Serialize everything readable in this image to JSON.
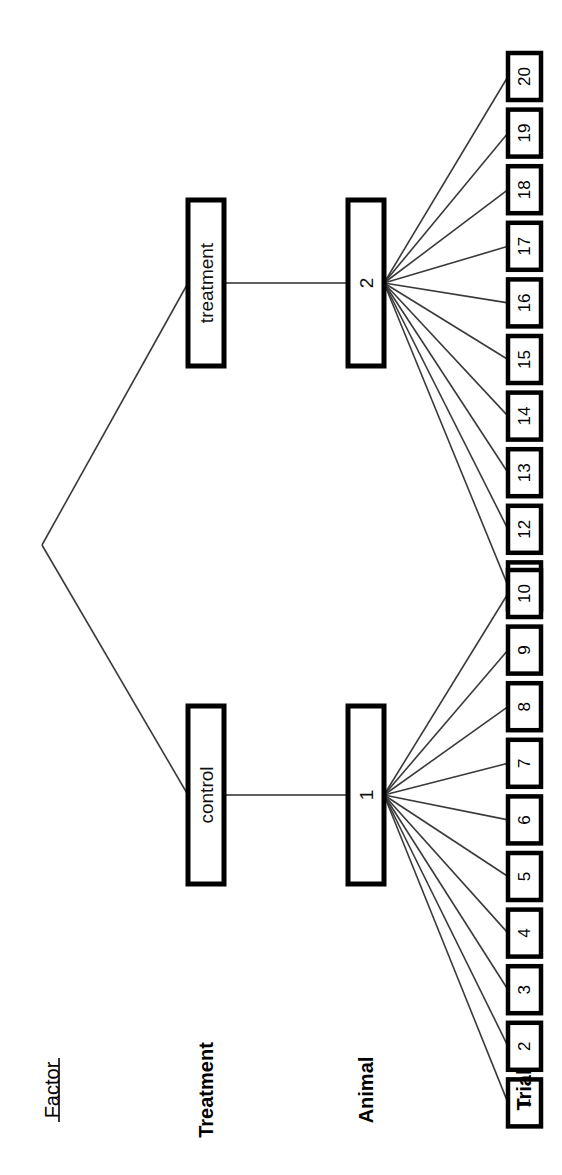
{
  "figure": {
    "orientation": "rotated-90-ccw",
    "background_color": "#ffffff",
    "line_color": "#000000",
    "connector_color": "#3a3a3a"
  },
  "row_labels": {
    "header": "Factor",
    "header_underlined": true,
    "rows": [
      {
        "label": "Treatment"
      },
      {
        "label": "Animal"
      },
      {
        "label": "Trial"
      }
    ]
  },
  "hierarchy": {
    "root_label": "",
    "treatment_level": [
      {
        "label": "treatment"
      },
      {
        "label": "control"
      }
    ],
    "animal_level": [
      {
        "label": "2",
        "parent": "treatment"
      },
      {
        "label": "1",
        "parent": "control"
      }
    ],
    "trial_level": {
      "animal_2_trials": [
        "20",
        "19",
        "18",
        "17",
        "16",
        "15",
        "14",
        "13",
        "12",
        "11"
      ],
      "animal_1_trials": [
        "10",
        "9",
        "8",
        "7",
        "6",
        "5",
        "4",
        "3",
        "2",
        "1"
      ]
    }
  },
  "chart_data": {
    "type": "diagram",
    "levels": [
      "Factor",
      "Treatment",
      "Animal",
      "Trial"
    ],
    "nodes": {
      "treatment": [
        "treatment",
        "control"
      ],
      "animal": [
        "2",
        "1"
      ],
      "trial": [
        "1",
        "2",
        "3",
        "4",
        "5",
        "6",
        "7",
        "8",
        "9",
        "10",
        "11",
        "12",
        "13",
        "14",
        "15",
        "16",
        "17",
        "18",
        "19",
        "20"
      ]
    },
    "edges": [
      {
        "from": "root",
        "to": "treatment"
      },
      {
        "from": "root",
        "to": "control"
      },
      {
        "from": "treatment",
        "to": "2"
      },
      {
        "from": "control",
        "to": "1"
      },
      {
        "from": "2",
        "to": "11"
      },
      {
        "from": "2",
        "to": "12"
      },
      {
        "from": "2",
        "to": "13"
      },
      {
        "from": "2",
        "to": "14"
      },
      {
        "from": "2",
        "to": "15"
      },
      {
        "from": "2",
        "to": "16"
      },
      {
        "from": "2",
        "to": "17"
      },
      {
        "from": "2",
        "to": "18"
      },
      {
        "from": "2",
        "to": "19"
      },
      {
        "from": "2",
        "to": "20"
      },
      {
        "from": "1",
        "to": "1"
      },
      {
        "from": "1",
        "to": "2"
      },
      {
        "from": "1",
        "to": "3"
      },
      {
        "from": "1",
        "to": "4"
      },
      {
        "from": "1",
        "to": "5"
      },
      {
        "from": "1",
        "to": "6"
      },
      {
        "from": "1",
        "to": "7"
      },
      {
        "from": "1",
        "to": "8"
      },
      {
        "from": "1",
        "to": "9"
      },
      {
        "from": "1",
        "to": "10"
      }
    ]
  }
}
